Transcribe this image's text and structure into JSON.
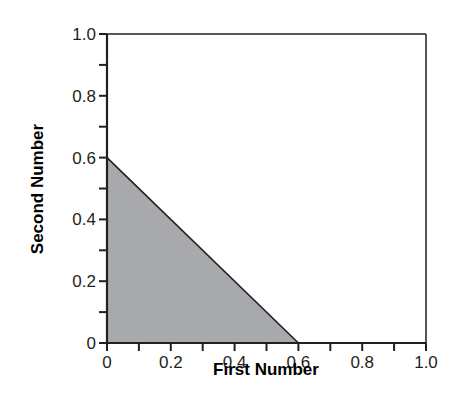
{
  "chart_data": {
    "type": "area",
    "title": "",
    "xlabel": "First Number",
    "ylabel": "Second Number",
    "xlim": [
      0,
      1.0
    ],
    "ylim": [
      0,
      1.0
    ],
    "x_tick_labels": [
      "0",
      "0.2",
      "0.4",
      "0.6",
      "0.8",
      "1.0"
    ],
    "y_tick_labels": [
      "0",
      "0.2",
      "0.4",
      "0.6",
      "0.8",
      "1.0"
    ],
    "minor_ticks_step": 0.1,
    "grid": false,
    "legend": null,
    "series": [
      {
        "name": "shaded region (x + y <= 0.6)",
        "points": [
          [
            0,
            0
          ],
          [
            0,
            0.6
          ],
          [
            0.6,
            0
          ]
        ],
        "fill": "#a7a9ac",
        "stroke": "#231f20"
      }
    ]
  },
  "colors": {
    "fill": "#a7a9ac",
    "axis": "#231f20",
    "background": "#ffffff"
  }
}
